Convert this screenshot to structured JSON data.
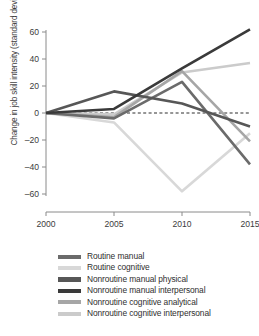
{
  "chart_data": {
    "type": "line",
    "title": "",
    "xlabel": "",
    "ylabel": "Change in job skill intensity (standard deviation)",
    "x": [
      2000,
      2005,
      2010,
      2015
    ],
    "xticklabels": [
      "2000",
      "2005",
      "2010",
      "2015"
    ],
    "yticklabels": [
      "60",
      "40",
      "20",
      "0",
      "–20",
      "–40",
      "–60"
    ],
    "yticks": [
      60,
      40,
      20,
      0,
      -20,
      -40,
      -60
    ],
    "xlim": [
      2000,
      2015
    ],
    "ylim": [
      -66,
      66
    ],
    "grid": false,
    "legend_position": "bottom",
    "zero_reference_line": true,
    "series": [
      {
        "name": "Routine manual",
        "color": "#6b6b6b",
        "values": [
          0,
          -4,
          23,
          -38
        ]
      },
      {
        "name": "Routine cognitive",
        "color": "#d8d8d8",
        "values": [
          0,
          -7,
          -58,
          -15
        ]
      },
      {
        "name": "Nonroutine manual physical",
        "color": "#575757",
        "values": [
          0,
          16,
          7,
          -10
        ]
      },
      {
        "name": "Nonroutine manual interpersonal",
        "color": "#3a3a3a",
        "values": [
          0,
          3,
          33,
          62
        ]
      },
      {
        "name": "Nonroutine cognitive analytical",
        "color": "#a6a6a6",
        "values": [
          0,
          -3,
          31,
          -21
        ]
      },
      {
        "name": "Nonroutine cognitive interpersonal",
        "color": "#cbcbcb",
        "values": [
          0,
          -1,
          30,
          37
        ]
      }
    ]
  },
  "legend": {
    "items": [
      {
        "label": "Routine manual",
        "color": "#6b6b6b"
      },
      {
        "label": "Routine cognitive",
        "color": "#d8d8d8"
      },
      {
        "label": "Nonroutine manual physical",
        "color": "#575757"
      },
      {
        "label": "Nonroutine manual interpersonal",
        "color": "#3a3a3a"
      },
      {
        "label": "Nonroutine cognitive analytical",
        "color": "#a6a6a6"
      },
      {
        "label": "Nonroutine cognitive interpersonal",
        "color": "#cbcbcb"
      }
    ]
  }
}
